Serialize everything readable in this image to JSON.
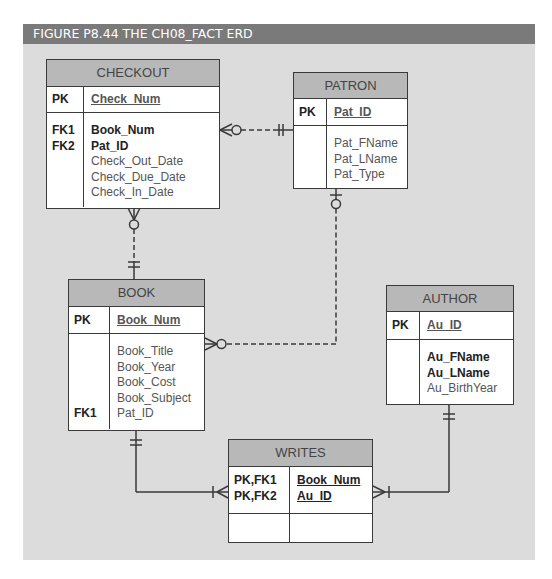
{
  "figure": {
    "title": "FIGURE P8.44  THE CH08_FACT ERD",
    "colors": {
      "title_bar": "#7a7a7a",
      "canvas": "#dcdcdc",
      "entity_header": "#b8b8b8",
      "entity_body": "#ffffff",
      "line": "#3a3a3a"
    }
  },
  "entities": {
    "checkout": {
      "name": "CHECKOUT",
      "pk_label": "PK",
      "pk_attr": "Check_Num",
      "keys": [
        "FK1",
        "FK2"
      ],
      "attributes": [
        {
          "name": "Book_Num",
          "bold": true
        },
        {
          "name": "Pat_ID",
          "bold": true
        },
        {
          "name": "Check_Out_Date",
          "bold": false
        },
        {
          "name": "Check_Due_Date",
          "bold": false
        },
        {
          "name": "Check_In_Date",
          "bold": false
        }
      ]
    },
    "patron": {
      "name": "PATRON",
      "pk_label": "PK",
      "pk_attr": "Pat_ID",
      "attributes": [
        {
          "name": "Pat_FName",
          "bold": false
        },
        {
          "name": "Pat_LName",
          "bold": false
        },
        {
          "name": "Pat_Type",
          "bold": false
        }
      ]
    },
    "book": {
      "name": "BOOK",
      "pk_label": "PK",
      "pk_attr": "Book_Num",
      "fk_label": "FK1",
      "attributes": [
        {
          "name": "Book_Title",
          "bold": false
        },
        {
          "name": "Book_Year",
          "bold": false
        },
        {
          "name": "Book_Cost",
          "bold": false
        },
        {
          "name": "Book_Subject",
          "bold": false
        },
        {
          "name": "Pat_ID",
          "bold": false
        }
      ]
    },
    "author": {
      "name": "AUTHOR",
      "pk_label": "PK",
      "pk_attr": "Au_ID",
      "attributes": [
        {
          "name": "Au_FName",
          "bold": true
        },
        {
          "name": "Au_LName",
          "bold": true
        },
        {
          "name": "Au_BirthYear",
          "bold": false
        }
      ]
    },
    "writes": {
      "name": "WRITES",
      "pk_labels": [
        "PK,FK1",
        "PK,FK2"
      ],
      "pk_attrs": [
        "Book_Num",
        "Au_ID"
      ]
    }
  },
  "relationships": [
    {
      "from": "PATRON",
      "to": "CHECKOUT",
      "from_cardinality": "one-and-only-one",
      "to_cardinality": "zero-or-many",
      "style": "dashed"
    },
    {
      "from": "BOOK",
      "to": "CHECKOUT",
      "from_cardinality": "one-and-only-one",
      "to_cardinality": "zero-or-many",
      "style": "dashed"
    },
    {
      "from": "PATRON",
      "to": "BOOK",
      "from_cardinality": "zero-or-one",
      "to_cardinality": "zero-or-many",
      "style": "dashed"
    },
    {
      "from": "BOOK",
      "to": "WRITES",
      "from_cardinality": "one-and-only-one",
      "to_cardinality": "one-or-many",
      "style": "solid"
    },
    {
      "from": "AUTHOR",
      "to": "WRITES",
      "from_cardinality": "one-and-only-one",
      "to_cardinality": "one-or-many",
      "style": "solid"
    }
  ]
}
